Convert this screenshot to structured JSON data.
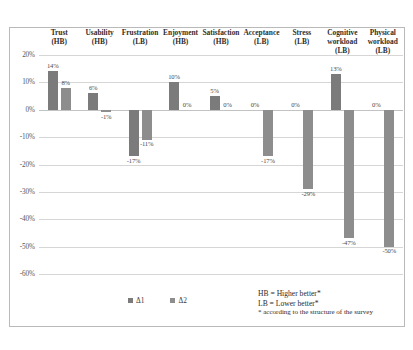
{
  "chart_data": {
    "type": "bar",
    "title": "",
    "xlabel": "",
    "ylabel": "",
    "ylim": [
      -60,
      20
    ],
    "ytick_labels": [
      "20%",
      "10%",
      "0%",
      "-10%",
      "-20%",
      "-30%",
      "-40%",
      "-50%",
      "-60%"
    ],
    "ytick_values": [
      20,
      10,
      0,
      -10,
      -20,
      -30,
      -40,
      -50,
      -60
    ],
    "grid": true,
    "legend_position": "bottom-center",
    "categories": [
      "Trust (HB)",
      "Usability (HB)",
      "Frustration (LB)",
      "Enjoyment (HB)",
      "Satisfaction (HB)",
      "Acceptance (LB)",
      "Stress (LB)",
      "Cognitive workload (LB)",
      "Physical workload (LB)"
    ],
    "category_lines": [
      [
        "Trust",
        "(HB)"
      ],
      [
        "Usability",
        "(HB)"
      ],
      [
        "Frustration",
        "(LB)"
      ],
      [
        "Enjoyment",
        "(HB)"
      ],
      [
        "Satisfaction",
        "(HB)"
      ],
      [
        "Acceptance",
        "(LB)"
      ],
      [
        "Stress",
        "(LB)"
      ],
      [
        "Cognitive workload",
        "(LB)"
      ],
      [
        "Physical workload",
        "(LB)"
      ]
    ],
    "series": [
      {
        "name": "Δ1",
        "color": "#7b7b7b",
        "values": [
          14,
          6,
          -17,
          10,
          5,
          0,
          0,
          13,
          0
        ],
        "labels": [
          "14%",
          "6%",
          "-17%",
          "10%",
          "5%",
          "0%",
          "0%",
          "13%",
          "0%"
        ]
      },
      {
        "name": "Δ2",
        "color": "#8d8d8d",
        "values": [
          8,
          -1,
          -11,
          0,
          0,
          -17,
          -29,
          -47,
          -50
        ],
        "labels": [
          "8%",
          "-1%",
          "-11%",
          "0%",
          "0%",
          "-17%",
          "-29%",
          "-47%",
          "-50%"
        ]
      }
    ]
  },
  "legend": {
    "items": [
      {
        "label": "Δ1"
      },
      {
        "label": "Δ2"
      }
    ]
  },
  "notes": {
    "line1": "HB = Higher better*",
    "line2": "LB = Lower better*",
    "line3": "* according to the structure of the survey"
  }
}
